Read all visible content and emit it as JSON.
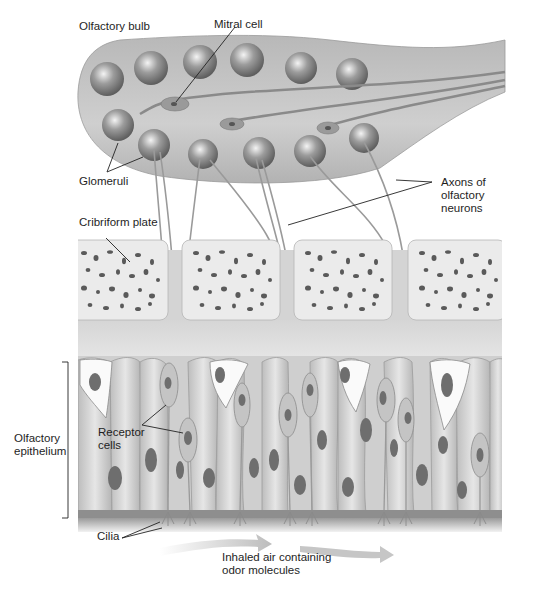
{
  "figure": {
    "labels": {
      "olfactory_bulb": "Olfactory bulb",
      "mitral_cell": "Mitral cell",
      "glomeruli": "Glomeruli",
      "axons_line1": "Axons of",
      "axons_line2": "olfactory",
      "axons_line3": "neurons",
      "cribriform_plate": "Cribriform plate",
      "olfactory_line1": "Olfactory",
      "olfactory_line2": "epithelium",
      "receptor_line1": "Receptor",
      "receptor_line2": "cells",
      "cilia": "Cilia",
      "air_line1": "Inhaled air containing",
      "air_line2": "odor molecules"
    },
    "colors": {
      "bulb_fill": "#c4c4c4",
      "bone_fill": "#e6e6e6",
      "pore_fill": "#5a5a5a",
      "epithelium_fill": "#d2d2d2",
      "nucleus_fill": "#6e6e6e",
      "arrow_fill": "#c8c8c8",
      "leader_line": "#222222"
    }
  }
}
